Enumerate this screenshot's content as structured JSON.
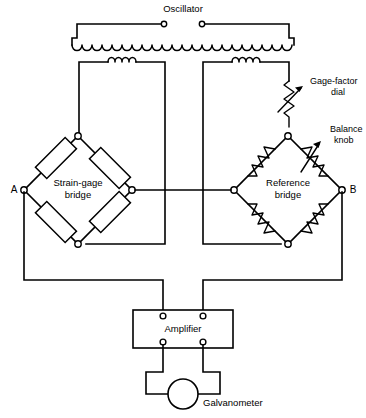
{
  "figure": {
    "width": 366,
    "height": 418,
    "background": "#ffffff",
    "ink": "#000000"
  },
  "labels": {
    "oscillator": "Oscillator",
    "gage_factor_dial_line1": "Gage-factor",
    "gage_factor_dial_line2": "dial",
    "balance_knob_line1": "Balance",
    "balance_knob_line2": "knob",
    "strain_gage_bridge_line1": "Strain-gage",
    "strain_gage_bridge_line2": "bridge",
    "reference_bridge_line1": "Reference",
    "reference_bridge_line2": "bridge",
    "terminal_a": "A",
    "terminal_b": "B",
    "amplifier": "Amplifier",
    "galvanometer": "Galvanometer"
  },
  "caption": {
    "text": "",
    "visible": false
  },
  "components": {
    "oscillator_terminals": 2,
    "transformer_primary_turns": 22,
    "transformer_secondary_left_turns": 4,
    "transformer_secondary_right_turns": 4,
    "strain_gages": 4,
    "reference_resistors": 4,
    "variable_resistors": 2,
    "nodes_count": 14,
    "amplifier_terminals": 4,
    "galvanometer_count": 1
  },
  "geometry": {
    "osc_left_x": 77,
    "osc_right_x": 289,
    "osc_top_y": 24,
    "primary_y": 44,
    "secondary_y": 62,
    "left_sec_x1": 79,
    "left_sec_x2": 165,
    "right_sec_x1": 203,
    "right_sec_x2": 289,
    "left_bridge_cx": 78,
    "left_bridge_cy": 190,
    "left_bridge_r": 54,
    "right_bridge_cx": 288,
    "right_bridge_cy": 190,
    "right_bridge_r": 54,
    "amp_x": 133,
    "amp_y": 310,
    "amp_w": 100,
    "amp_h": 38,
    "galv_cx": 183,
    "galv_cy": 394,
    "galv_r": 15
  }
}
